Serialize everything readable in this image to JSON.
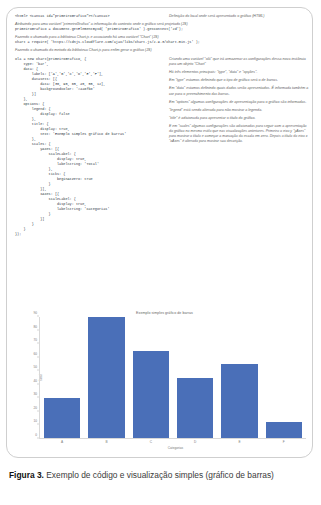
{
  "figure": {
    "caption_label": "Figura 3.",
    "caption_text": " Exemplo de código e visualização simples (gráfico de barras)"
  },
  "annotations": {
    "html_canvas": "Definição do local onde será apresentado o gráfico (HTML)",
    "context_var": "Atribuindo para uma variável \"primeiroGrafico\" a informação do contexto onde o gráfico será projetado (JS)",
    "require_chart": "Fazendo o chamado para a biblioteca Chart.js e associando há uma variável \"Chart\" (JS)",
    "call_method": "Fazendo o chamado do metodo da biblioteca Chart.js para enfim gerar o gráfico (JS)",
    "new_chart": "Criando uma variável \"olá\" que irá armazenar as configurações dessa nova instância para um objeto \"Chart\"",
    "three_elements": "Há três elementos principais: \"type\", \"data\" e \"opções\".",
    "type_note": "Em \"type\" estamos definindo que o tipo de gráfico será o de barras.",
    "data_note": "Em \"data\" estamos definindo quais dados serão apresentados. É informada também a cor para o preenchimento das barras.",
    "options_note": "Em \"options\" algumas configurações de apresentação para o gráfico são informadas.",
    "legend_note": "\"legend\" está sendo alterada para não mostrar a legenda.",
    "title_note": "\"title\" é adicionada para apresentar o título do gráfico.",
    "scales_note": "E em \"scales\" algumas configurações são adicionadas para seguir com a apresentação do gráfico no mesmo estilo que nas visualizações anteriores. Primeiro o eixo y \"yAxes\" para mostrar o título e começar a marcação da escala em zero. Depois o título do eixo x \"xAxes\" é alterado para mostrar sua descrição."
  },
  "code": {
    "html_line": "<html> <canvas id=\"primeiroGrafico\"></canvas>",
    "context_line": "primeiroGrafico = document.getElementById( 'primeiroGrafico' ).getContext('2d');",
    "require_line": "Chart = require( 'https://cdnjs.cloudflare.com/ajax/libs/Chart.js/2.9.3/Chart.min.js' );",
    "block": [
      "ola = new Chart(primeiroGrafico, {",
      "    type: 'bar',",
      "    data: {",
      "        labels: ['A','B','C','D','E','F'],",
      "        datasets: [{",
      "            data: [30, 90, 65, 45, 55, 12],",
      "            backgroundColor: '#4a6fb8'",
      "        }]",
      "    },",
      "    options: {",
      "        legend: {",
      "            display: false",
      "        },",
      "        title: {",
      "            display: true,",
      "            text: 'Exemplo simples gráfico de barras'",
      "        },",
      "        scales: {",
      "            yAxes: [{",
      "                scaleLabel: {",
      "                    display: true,",
      "                    labelString: 'Total'",
      "                },",
      "                ticks: {",
      "                    beginAtZero: true",
      "                }",
      "            }],",
      "            xAxes: [{",
      "                scaleLabel: {",
      "                    display: true,",
      "                    labelString: 'Categorias'",
      "                }",
      "            }]",
      "        }",
      "    }",
      "});"
    ]
  },
  "chart_data": {
    "type": "bar",
    "title": "Exemplo simples gráfico de barras",
    "categories": [
      "A",
      "B",
      "C",
      "D",
      "E",
      "F"
    ],
    "values": [
      30,
      90,
      65,
      45,
      55,
      12
    ],
    "xlabel": "Categorias",
    "ylabel": "Total",
    "ylim": [
      0,
      90
    ],
    "yticks": [
      0,
      10,
      20,
      30,
      40,
      50,
      60,
      70,
      80,
      90
    ],
    "bar_color": "#4a6fb8",
    "grid": false,
    "legend": false
  }
}
